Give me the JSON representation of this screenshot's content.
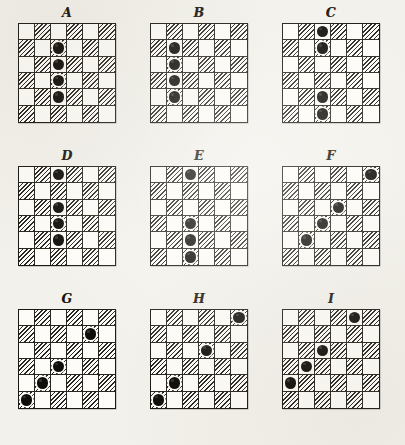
{
  "figure": {
    "board_rows": 6,
    "board_cols": 6,
    "colors": {
      "paper": "#f3f1eb",
      "square_light": "#fdfcf8",
      "square_dark_hatch": "#2b271e",
      "piece": "#100e0a",
      "border": "#1b1812"
    },
    "note": "Nine 6x6 checkerboards lettered A through I, each holding four black men."
  },
  "boards": [
    {
      "id": "board-a",
      "label": "A",
      "row": 0,
      "col": 0,
      "piece_count": 4,
      "pieces": [
        {
          "row": 2,
          "col": 3
        },
        {
          "row": 3,
          "col": 3
        },
        {
          "row": 4,
          "col": 3
        },
        {
          "row": 5,
          "col": 3
        }
      ]
    },
    {
      "id": "board-b",
      "label": "B",
      "row": 0,
      "col": 1,
      "piece_count": 4,
      "pieces": [
        {
          "row": 2,
          "col": 2
        },
        {
          "row": 3,
          "col": 2
        },
        {
          "row": 4,
          "col": 2
        },
        {
          "row": 5,
          "col": 2
        }
      ]
    },
    {
      "id": "board-c",
      "label": "C",
      "row": 0,
      "col": 2,
      "piece_count": 4,
      "pieces": [
        {
          "row": 1,
          "col": 3
        },
        {
          "row": 2,
          "col": 3
        },
        {
          "row": 5,
          "col": 3
        },
        {
          "row": 6,
          "col": 3
        }
      ]
    },
    {
      "id": "board-d",
      "label": "D",
      "row": 1,
      "col": 0,
      "piece_count": 4,
      "pieces": [
        {
          "row": 1,
          "col": 3
        },
        {
          "row": 3,
          "col": 3
        },
        {
          "row": 4,
          "col": 3
        },
        {
          "row": 5,
          "col": 3
        }
      ]
    },
    {
      "id": "board-e",
      "label": "E",
      "row": 1,
      "col": 1,
      "piece_count": 4,
      "pieces": [
        {
          "row": 1,
          "col": 3
        },
        {
          "row": 4,
          "col": 3
        },
        {
          "row": 5,
          "col": 3
        },
        {
          "row": 6,
          "col": 3
        }
      ]
    },
    {
      "id": "board-f",
      "label": "F",
      "row": 1,
      "col": 2,
      "piece_count": 4,
      "pieces": [
        {
          "row": 1,
          "col": 6
        },
        {
          "row": 3,
          "col": 4
        },
        {
          "row": 4,
          "col": 3
        },
        {
          "row": 5,
          "col": 2
        }
      ]
    },
    {
      "id": "board-g",
      "label": "G",
      "row": 2,
      "col": 0,
      "piece_count": 4,
      "pieces": [
        {
          "row": 2,
          "col": 5
        },
        {
          "row": 4,
          "col": 3
        },
        {
          "row": 5,
          "col": 2
        },
        {
          "row": 6,
          "col": 1
        }
      ]
    },
    {
      "id": "board-h",
      "label": "H",
      "row": 2,
      "col": 1,
      "piece_count": 4,
      "pieces": [
        {
          "row": 1,
          "col": 6
        },
        {
          "row": 3,
          "col": 4
        },
        {
          "row": 5,
          "col": 2
        },
        {
          "row": 6,
          "col": 1
        }
      ]
    },
    {
      "id": "board-i",
      "label": "I",
      "row": 2,
      "col": 2,
      "piece_count": 4,
      "pieces": [
        {
          "row": 1,
          "col": 5
        },
        {
          "row": 3,
          "col": 3
        },
        {
          "row": 4,
          "col": 2
        },
        {
          "row": 5,
          "col": 1
        }
      ]
    }
  ]
}
